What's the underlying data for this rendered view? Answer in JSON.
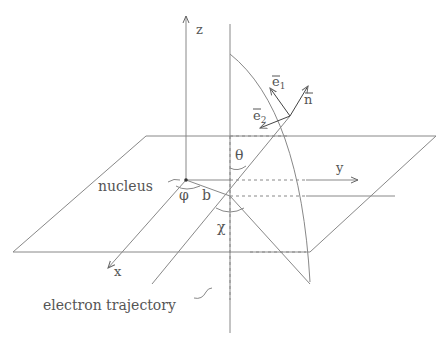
{
  "labels": {
    "z": "z",
    "y": "y",
    "x": "x",
    "e1": "e",
    "e1_sub": "1",
    "e2": "e",
    "e2_sub": "2",
    "n": "n",
    "theta": "θ",
    "phi": "φ",
    "b": "b",
    "chi": "χ",
    "nucleus": "nucleus",
    "electron_trajectory": "electron trajectory"
  },
  "colors": {
    "line": "#888888",
    "text": "#555555"
  }
}
